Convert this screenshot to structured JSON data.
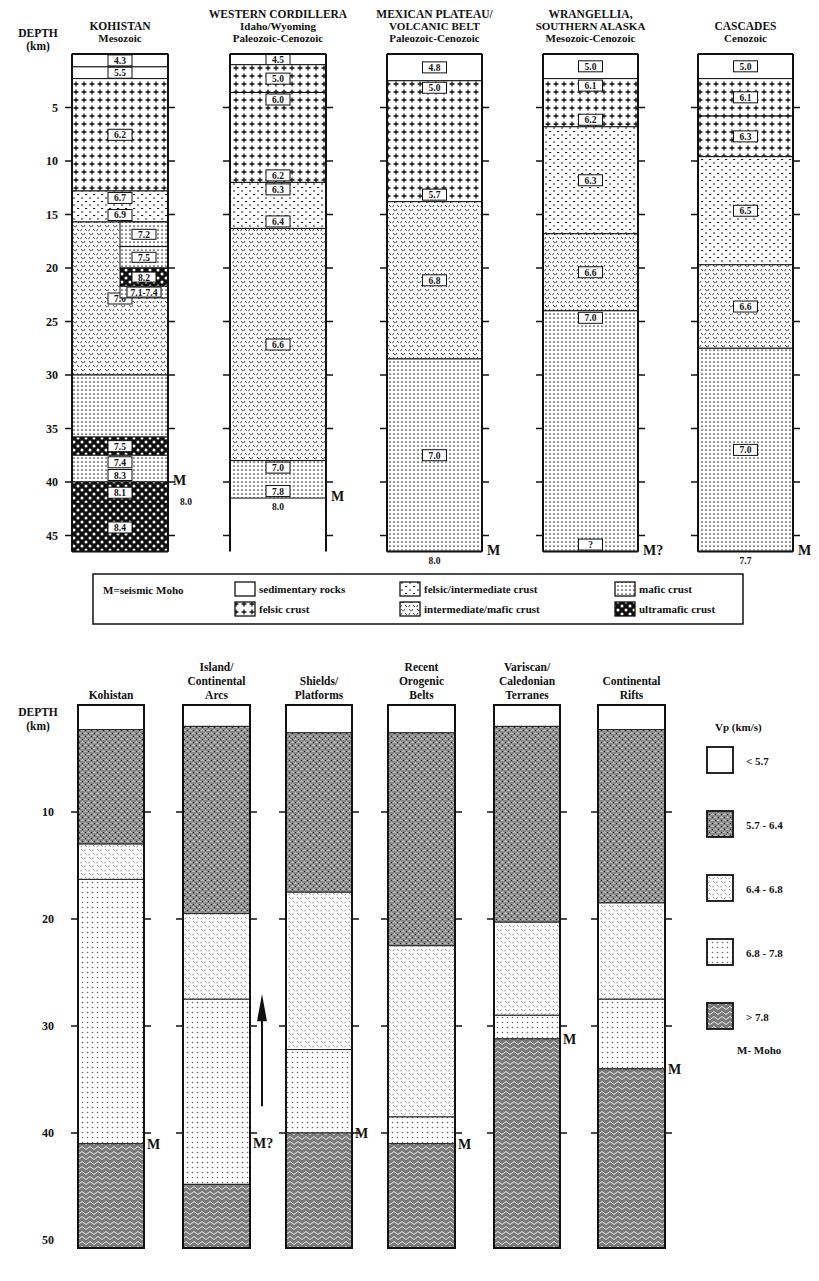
{
  "top_panel": {
    "depth_label": "DEPTH",
    "depth_unit": "(km)",
    "depth_ticks": [
      "5",
      "10",
      "15",
      "20",
      "25",
      "30",
      "35",
      "40",
      "45"
    ],
    "columns": [
      {
        "title": "KOHISTAN",
        "subtitle": "Mesozoic",
        "moho_label": "M",
        "below_moho_vp": "8.0",
        "layers": [
          {
            "top": 0,
            "bottom": 1.2,
            "type": "sedimentary",
            "vp": "4.3"
          },
          {
            "top": 1.2,
            "bottom": 2.3,
            "type": "sedimentary",
            "vp": "5.5"
          },
          {
            "top": 2.3,
            "bottom": 12.8,
            "type": "felsic",
            "vp": "6.2"
          },
          {
            "top": 12.8,
            "bottom": 15.7,
            "type": "felsic-intermediate",
            "vp": "6.7 / 6.9"
          },
          {
            "top": 15.7,
            "bottom": 30,
            "type": "intermediate-mafic",
            "vp": "7.0"
          },
          {
            "top": 30,
            "bottom": 35.8,
            "type": "mafic",
            "vp": ""
          },
          {
            "top": 35.8,
            "bottom": 37.5,
            "type": "ultramafic",
            "vp": "7.5"
          },
          {
            "top": 37.5,
            "bottom": 40,
            "type": "mafic",
            "vp": "7.4 / 8.3"
          },
          {
            "top": 40,
            "bottom": 42,
            "type": "ultramafic",
            "vp": "8.1"
          },
          {
            "top": 42,
            "bottom": 46.5,
            "type": "ultramafic",
            "vp": "8.4"
          }
        ],
        "inset_layers": [
          {
            "top": 15.7,
            "bottom": 18,
            "type": "mafic",
            "vp": "7.2"
          },
          {
            "top": 18,
            "bottom": 20,
            "type": "mafic",
            "vp": "7.5"
          },
          {
            "top": 20,
            "bottom": 21.7,
            "type": "ultramafic",
            "vp": "8.2"
          },
          {
            "top": 21.7,
            "bottom": 22.8,
            "type": "mafic",
            "vp": "7.1-7.4"
          }
        ]
      },
      {
        "title": "WESTERN CORDILLERA",
        "subtitle": "Idaho/Wyoming",
        "subtitle2": "Paleozoic-Cenozoic",
        "moho_label": "M",
        "below_moho_vp": "8.0",
        "layers": [
          {
            "top": 0,
            "bottom": 1,
            "type": "sedimentary",
            "vp": "4.5"
          },
          {
            "top": 1,
            "bottom": 3.6,
            "type": "felsic",
            "vp": "5.0"
          },
          {
            "top": 3.6,
            "bottom": 12,
            "type": "felsic",
            "vp": "6.0 / 6.2"
          },
          {
            "top": 12,
            "bottom": 16.3,
            "type": "felsic-intermediate",
            "vp": "6.3 / 6.4"
          },
          {
            "top": 16.3,
            "bottom": 38,
            "type": "intermediate-mafic",
            "vp": "6.6"
          },
          {
            "top": 38,
            "bottom": 41.5,
            "type": "mafic",
            "vp": "7.0 / 7.8"
          }
        ]
      },
      {
        "title": "MEXICAN PLATEAU/",
        "subtitle": "VOLCANIC BELT",
        "subtitle2": "Paleozoic-Cenozoic",
        "moho_label": "M",
        "below_moho_vp": "8.0",
        "layers": [
          {
            "top": 0,
            "bottom": 2.5,
            "type": "sedimentary",
            "vp": "4.8"
          },
          {
            "top": 2.5,
            "bottom": 13.8,
            "type": "felsic",
            "vp": "5.0 / 5.7"
          },
          {
            "top": 13.8,
            "bottom": 28.5,
            "type": "intermediate-mafic",
            "vp": "6.8"
          },
          {
            "top": 28.5,
            "bottom": 46.5,
            "type": "mafic",
            "vp": "7.0"
          }
        ]
      },
      {
        "title": "WRANGELLIA,",
        "subtitle": "SOUTHERN ALASKA",
        "subtitle2": "Mesozoic-Cenozoic",
        "moho_label": "M?",
        "below_moho_vp": "",
        "layers": [
          {
            "top": 0,
            "bottom": 2.3,
            "type": "sedimentary",
            "vp": "5.0"
          },
          {
            "top": 2.3,
            "bottom": 6.8,
            "type": "felsic",
            "vp": "6.1 / 6.2"
          },
          {
            "top": 6.8,
            "bottom": 16.8,
            "type": "felsic-intermediate",
            "vp": "6.3"
          },
          {
            "top": 16.8,
            "bottom": 24,
            "type": "intermediate-mafic",
            "vp": "6.6"
          },
          {
            "top": 24,
            "bottom": 46.5,
            "type": "mafic",
            "vp": "7.0 / ?"
          }
        ]
      },
      {
        "title": "CASCADES",
        "subtitle": "Cenozoic",
        "moho_label": "M",
        "below_moho_vp": "7.7",
        "layers": [
          {
            "top": 0,
            "bottom": 2.3,
            "type": "sedimentary",
            "vp": "5.0"
          },
          {
            "top": 2.3,
            "bottom": 5.8,
            "type": "felsic",
            "vp": "6.1"
          },
          {
            "top": 5.8,
            "bottom": 9.6,
            "type": "felsic",
            "vp": "6.3"
          },
          {
            "top": 9.6,
            "bottom": 19.7,
            "type": "felsic-intermediate",
            "vp": "6.5"
          },
          {
            "top": 19.7,
            "bottom": 27.5,
            "type": "intermediate-mafic",
            "vp": "6.6"
          },
          {
            "top": 27.5,
            "bottom": 46.5,
            "type": "mafic",
            "vp": "7.0"
          }
        ]
      }
    ],
    "legend": {
      "moho_note": "M=seismic Moho",
      "items": [
        {
          "type": "sedimentary",
          "label": "sedimentary rocks"
        },
        {
          "type": "felsic",
          "label": "felsic crust"
        },
        {
          "type": "felsic-intermediate",
          "label": "felsic/intermediate crust"
        },
        {
          "type": "intermediate-mafic",
          "label": "intermediate/mafic crust"
        },
        {
          "type": "mafic",
          "label": "mafic crust"
        },
        {
          "type": "ultramafic",
          "label": "ultramafic crust"
        }
      ]
    }
  },
  "bottom_panel": {
    "depth_label": "DEPTH",
    "depth_unit": "(km)",
    "depth_ticks": [
      "10",
      "20",
      "30",
      "40",
      "50"
    ],
    "columns": [
      {
        "title_lines": [
          "Kohistan"
        ],
        "moho_label": "M",
        "moho_depth": 41,
        "layers": [
          {
            "top": 0,
            "bottom": 2.3,
            "range": "<5.7"
          },
          {
            "top": 2.3,
            "bottom": 13,
            "range": "5.7-6.4"
          },
          {
            "top": 13,
            "bottom": 16.3,
            "range": "6.4-6.8"
          },
          {
            "top": 16.3,
            "bottom": 41,
            "range": "6.8-7.8"
          },
          {
            "top": 41,
            "bottom": 51,
            "range": ">7.8"
          }
        ]
      },
      {
        "title_lines": [
          "Island/",
          "Continental",
          "Arcs"
        ],
        "moho_label": "M?",
        "moho_depth": 44.8,
        "layers": [
          {
            "top": 0,
            "bottom": 2,
            "range": "<5.7"
          },
          {
            "top": 2,
            "bottom": 19.5,
            "range": "5.7-6.4"
          },
          {
            "top": 19.5,
            "bottom": 27.5,
            "range": "6.4-6.8"
          },
          {
            "top": 27.5,
            "bottom": 44.8,
            "range": "6.8-7.8"
          },
          {
            "top": 44.8,
            "bottom": 51,
            "range": ">7.8"
          }
        ]
      },
      {
        "title_lines": [
          "Shields/",
          "Platforms"
        ],
        "moho_label": "M",
        "moho_depth": 40,
        "layers": [
          {
            "top": 0,
            "bottom": 2.6,
            "range": "<5.7"
          },
          {
            "top": 2.6,
            "bottom": 17.5,
            "range": "5.7-6.4"
          },
          {
            "top": 17.5,
            "bottom": 32.2,
            "range": "6.4-6.8"
          },
          {
            "top": 32.2,
            "bottom": 40,
            "range": "6.8-7.8"
          },
          {
            "top": 40,
            "bottom": 51,
            "range": ">7.8"
          }
        ]
      },
      {
        "title_lines": [
          "Recent",
          "Orogenic",
          "Belts"
        ],
        "moho_label": "M",
        "moho_depth": 41,
        "layers": [
          {
            "top": 0,
            "bottom": 2.6,
            "range": "<5.7"
          },
          {
            "top": 2.6,
            "bottom": 22.5,
            "range": "5.7-6.4"
          },
          {
            "top": 22.5,
            "bottom": 38.5,
            "range": "6.4-6.8"
          },
          {
            "top": 38.5,
            "bottom": 41,
            "range": "6.8-7.8"
          },
          {
            "top": 41,
            "bottom": 51,
            "range": ">7.8"
          }
        ]
      },
      {
        "title_lines": [
          "Variscan/",
          "Caledonian",
          "Terranes"
        ],
        "moho_label": "M",
        "moho_depth": 31.2,
        "layers": [
          {
            "top": 0,
            "bottom": 2,
            "range": "<5.7"
          },
          {
            "top": 2,
            "bottom": 20.3,
            "range": "5.7-6.4"
          },
          {
            "top": 20.3,
            "bottom": 29,
            "range": "6.4-6.8"
          },
          {
            "top": 29,
            "bottom": 31.2,
            "range": "6.8-7.8"
          },
          {
            "top": 31.2,
            "bottom": 51,
            "range": ">7.8"
          }
        ]
      },
      {
        "title_lines": [
          "Continental",
          "Rifts"
        ],
        "moho_label": "M",
        "moho_depth": 34,
        "layers": [
          {
            "top": 0,
            "bottom": 2.3,
            "range": "<5.7"
          },
          {
            "top": 2.3,
            "bottom": 18.5,
            "range": "5.7-6.4"
          },
          {
            "top": 18.5,
            "bottom": 27.5,
            "range": "6.4-6.8"
          },
          {
            "top": 27.5,
            "bottom": 34,
            "range": "6.8-7.8"
          },
          {
            "top": 34,
            "bottom": 51,
            "range": ">7.8"
          }
        ]
      }
    ],
    "legend": {
      "title": "Vp (km/s)",
      "items": [
        {
          "range": "<5.7",
          "label": "< 5.7"
        },
        {
          "range": "5.7-6.4",
          "label": "5.7 - 6.4"
        },
        {
          "range": "6.4-6.8",
          "label": "6.4 - 6.8"
        },
        {
          "range": "6.8-7.8",
          "label": "6.8 - 7.8"
        },
        {
          "range": ">7.8",
          "label": "> 7.8"
        }
      ],
      "moho_note": "M- Moho"
    }
  }
}
